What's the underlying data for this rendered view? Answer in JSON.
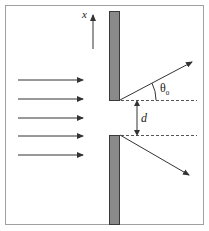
{
  "diagram": {
    "labels": {
      "axis": "x",
      "angle": "θ",
      "angle_subscript": "0",
      "separation": "d"
    },
    "colors": {
      "frame": "#a0a0a0",
      "wall_fill": "#8a8a8a",
      "wall_stroke": "#3a3a3a",
      "arrow": "#333333",
      "dashed": "#555555"
    },
    "incident_rays": 5,
    "elements": [
      "frame",
      "x-axis-arrow",
      "upper-wall",
      "lower-wall",
      "incident-rays",
      "diffracted-ray-up",
      "diffracted-ray-down",
      "reference-dashed-lines",
      "separation-dimension-arrow",
      "angle-arc"
    ]
  }
}
